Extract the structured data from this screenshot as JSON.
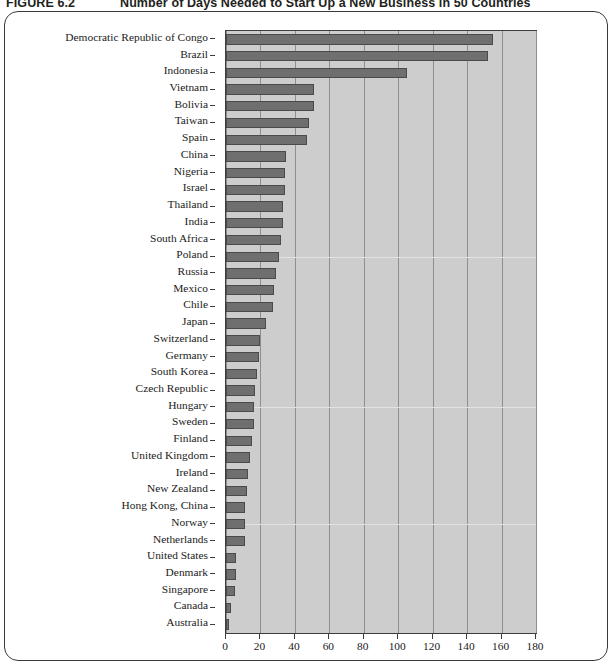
{
  "figure": {
    "number": "FIGURE 6.2",
    "title": "Number of Days Needed to Start Up a New Business in 50 Countries"
  },
  "chart_data": {
    "type": "bar",
    "orientation": "horizontal",
    "title": "Number of Days Needed to Start Up a New Business in 50 Countries",
    "xlabel": "",
    "ylabel": "",
    "xlim": [
      0,
      180
    ],
    "xticks": [
      0,
      20,
      40,
      60,
      80,
      100,
      120,
      140,
      160,
      180
    ],
    "grid": "vertical",
    "legend": "none",
    "bar_color": "#6f6f6f",
    "plot_background": "#cdcdcd",
    "categories": [
      "Democratic Republic of Congo",
      "Brazil",
      "Indonesia",
      "Vietnam",
      "Bolivia",
      "Taiwan",
      "Spain",
      "China",
      "Nigeria",
      "Israel",
      "Thailand",
      "India",
      "South Africa",
      "Poland",
      "Russia",
      "Mexico",
      "Chile",
      "Japan",
      "Switzerland",
      "Germany",
      "South Korea",
      "Czech Republic",
      "Hungary",
      "Sweden",
      "Finland",
      "United Kingdom",
      "Ireland",
      "New Zealand",
      "Hong Kong, China",
      "Norway",
      "Netherlands",
      "United States",
      "Denmark",
      "Singapore",
      "Canada",
      "Australia"
    ],
    "values": [
      155,
      152,
      105,
      51,
      51,
      48,
      47,
      35,
      34,
      34,
      33,
      33,
      32,
      31,
      29,
      28,
      27,
      23,
      20,
      19,
      18,
      17,
      16,
      16,
      15,
      14,
      13,
      12,
      11,
      11,
      11,
      6,
      6,
      5,
      3,
      2
    ]
  }
}
